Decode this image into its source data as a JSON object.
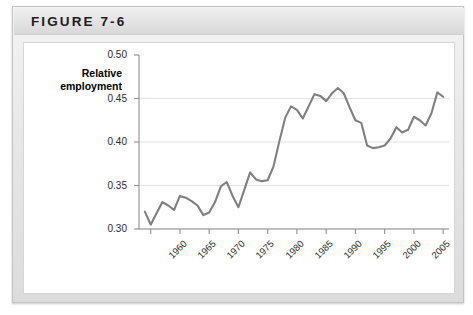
{
  "figure": {
    "title": "FIGURE 7-6"
  },
  "chart_data": {
    "type": "line",
    "title": "",
    "xlabel": "",
    "ylabel": "Relative employment",
    "ylabel_lines": [
      "Relative",
      "employment"
    ],
    "xlim": [
      1958,
      2011
    ],
    "ylim": [
      0.3,
      0.5
    ],
    "grid": true,
    "legend": "none",
    "line_color": "#808080",
    "y_ticks": [
      "0.50",
      "0.45",
      "0.40",
      "0.35",
      "0.30"
    ],
    "y_tick_values": [
      0.5,
      0.45,
      0.4,
      0.35,
      0.3
    ],
    "x_ticks": [
      "1960",
      "1965",
      "1970",
      "1975",
      "1980",
      "1985",
      "1990",
      "1995",
      "2000",
      "2005",
      "2010"
    ],
    "x_tick_values": [
      1960,
      1965,
      1970,
      1975,
      1980,
      1985,
      1990,
      1995,
      2000,
      2005,
      2010
    ],
    "series": [
      {
        "name": "Relative employment",
        "x": [
          1959,
          1960,
          1961,
          1962,
          1963,
          1964,
          1965,
          1966,
          1967,
          1968,
          1969,
          1970,
          1971,
          1972,
          1973,
          1974,
          1975,
          1976,
          1977,
          1978,
          1979,
          1980,
          1981,
          1982,
          1983,
          1984,
          1985,
          1986,
          1987,
          1988,
          1989,
          1990,
          1991,
          1992,
          1993,
          1994,
          1995,
          1996,
          1997,
          1998,
          1999,
          2000,
          2001,
          2002,
          2003,
          2004,
          2005,
          2006,
          2007,
          2008,
          2009,
          2010
        ],
        "values": [
          0.32,
          0.305,
          0.318,
          0.331,
          0.327,
          0.322,
          0.338,
          0.336,
          0.332,
          0.327,
          0.316,
          0.319,
          0.331,
          0.349,
          0.354,
          0.338,
          0.325,
          0.345,
          0.365,
          0.357,
          0.355,
          0.356,
          0.372,
          0.401,
          0.428,
          0.441,
          0.437,
          0.427,
          0.441,
          0.455,
          0.453,
          0.447,
          0.456,
          0.462,
          0.456,
          0.44,
          0.425,
          0.422,
          0.396,
          0.393,
          0.394,
          0.396,
          0.404,
          0.417,
          0.411,
          0.414,
          0.429,
          0.425,
          0.419,
          0.433,
          0.457,
          0.452
        ]
      }
    ]
  }
}
